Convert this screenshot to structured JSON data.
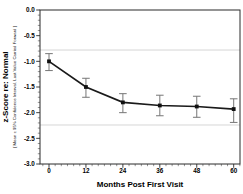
{
  "chart_data": {
    "type": "line",
    "title": "",
    "xlabel": "Months Post First Visit",
    "ylabel": "z-Score re: Normal",
    "ylabel_sub": "[ Mean ± 95% Confidence Interval, Last Value Carried Forward ]",
    "x": [
      0,
      12,
      24,
      36,
      48,
      60
    ],
    "series": [
      {
        "name": "mean-z-score-lvcf",
        "values": [
          -1.0,
          -1.5,
          -1.8,
          -1.86,
          -1.88,
          -1.93
        ],
        "ci_low": [
          -1.18,
          -1.7,
          -2.0,
          -2.06,
          -2.09,
          -2.19
        ],
        "ci_high": [
          -0.85,
          -1.33,
          -1.63,
          -1.66,
          -1.68,
          -1.73
        ]
      }
    ],
    "xlim": [
      -3,
      62.5
    ],
    "ylim": [
      -3.0,
      0.0
    ],
    "x_ticks": [
      0,
      12,
      24,
      36,
      48,
      60
    ],
    "x_tick_labels": [
      "0",
      "12",
      "24",
      "36",
      "48",
      "60"
    ],
    "y_ticks": [
      0.0,
      -0.5,
      -1.0,
      -1.5,
      -2.0,
      -2.5,
      -3.0
    ],
    "y_tick_labels": [
      "0.0",
      "-0.5",
      "-1.0",
      "-1.5",
      "-2.0",
      "-2.5",
      "-3.0"
    ],
    "x_minor_step": 2,
    "y_minor_step": 0.1,
    "reference_lines": [
      -0.78,
      -2.24
    ],
    "grid": false,
    "legend": "none",
    "marker": "square",
    "colors": {
      "line": "#1a1a1a",
      "marker": "#111111",
      "error_bar": "#767676",
      "reference_line": "#cccccc",
      "frame": "#2b2b2b",
      "tick": "#2b2b2b",
      "background": "#ffffff"
    }
  }
}
